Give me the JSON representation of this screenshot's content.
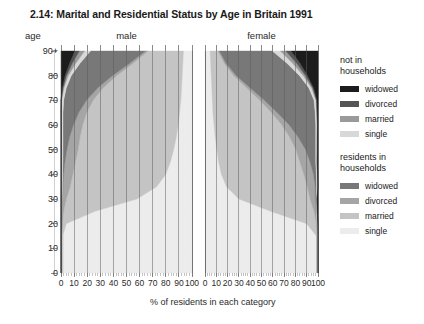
{
  "figure": {
    "title": "2.14: Marital and Residential Status by Age in Britain 1991",
    "age_axis_label": "age",
    "x_caption": "% of residents in each category"
  },
  "legend": {
    "groups": [
      {
        "heading_line1": "not in",
        "heading_line2": "households",
        "items": [
          {
            "label": "widowed",
            "color": "#1c1c1c"
          },
          {
            "label": "divorced",
            "color": "#555555"
          },
          {
            "label": "married",
            "color": "#9a9a9a"
          },
          {
            "label": "single",
            "color": "#d8d8d8"
          }
        ]
      },
      {
        "heading_line1": "residents in",
        "heading_line2": "households",
        "items": [
          {
            "label": "widowed",
            "color": "#787878"
          },
          {
            "label": "divorced",
            "color": "#a5a5a5"
          },
          {
            "label": "married",
            "color": "#c4c4c4"
          },
          {
            "label": "single",
            "color": "#ececec"
          }
        ]
      }
    ]
  },
  "chart_data": {
    "type": "area",
    "title": "2.14: Marital and Residential Status by Age in Britain 1991",
    "xlabel": "% of residents in each category",
    "ylabel": "age",
    "ylim": [
      0,
      90
    ],
    "xlim": [
      0,
      100
    ],
    "grid": true,
    "y_ticks": [
      "0",
      "10",
      "20",
      "30",
      "40",
      "50",
      "60",
      "70",
      "80",
      "90+"
    ],
    "y_tick_values": [
      0,
      10,
      20,
      30,
      40,
      50,
      60,
      70,
      80,
      90
    ],
    "x_ticks_male": [
      "100",
      "90",
      "80",
      "70",
      "60",
      "50",
      "40",
      "30",
      "20",
      "10",
      "0"
    ],
    "x_ticks_female": [
      "0",
      "10",
      "20",
      "30",
      "40",
      "50",
      "60",
      "70",
      "80",
      "90",
      "100"
    ],
    "x_tick_values": [
      0,
      10,
      20,
      30,
      40,
      50,
      60,
      70,
      80,
      90,
      100
    ],
    "panels": [
      {
        "name": "male",
        "label": "male",
        "x_direction": "reversed"
      },
      {
        "name": "female",
        "label": "female",
        "x_direction": "normal"
      }
    ],
    "stack_order_from_axis_origin": [
      "single_in_households",
      "married_in_households",
      "divorced_in_households",
      "widowed_in_households",
      "single_not_in_households",
      "married_not_in_households",
      "divorced_not_in_households",
      "widowed_not_in_households"
    ],
    "ages": [
      0,
      5,
      10,
      15,
      20,
      25,
      30,
      35,
      40,
      45,
      50,
      55,
      60,
      65,
      70,
      75,
      80,
      85,
      90
    ],
    "series": {
      "male": [
        {
          "name": "single_in_households",
          "color": "#ececec",
          "values": [
            98.8,
            98.8,
            98.8,
            98.6,
            96.0,
            74.0,
            42.0,
            27.0,
            20.0,
            16.5,
            14.0,
            12.0,
            10.5,
            9.5,
            8.5,
            8.0,
            7.5,
            7.0,
            6.5
          ]
        },
        {
          "name": "married_in_households",
          "color": "#c4c4c4",
          "values": [
            0.0,
            0.0,
            0.0,
            0.2,
            3.0,
            24.0,
            54.0,
            66.0,
            71.0,
            72.5,
            73.0,
            73.5,
            73.0,
            71.0,
            67.0,
            60.0,
            50.0,
            38.0,
            27.0
          ]
        },
        {
          "name": "divorced_in_households",
          "color": "#a5a5a5",
          "values": [
            0.0,
            0.0,
            0.0,
            0.0,
            0.3,
            1.2,
            3.0,
            5.5,
            7.0,
            8.0,
            8.5,
            8.0,
            7.0,
            6.0,
            5.0,
            4.0,
            3.2,
            2.5,
            2.0
          ]
        },
        {
          "name": "widowed_in_households",
          "color": "#787878",
          "values": [
            0.0,
            0.0,
            0.0,
            0.0,
            0.0,
            0.1,
            0.2,
            0.4,
            0.8,
            1.6,
            3.0,
            5.0,
            8.0,
            12.0,
            17.5,
            24.0,
            31.5,
            38.0,
            42.0
          ]
        },
        {
          "name": "single_not_in_households",
          "color": "#d8d8d8",
          "values": [
            1.2,
            1.2,
            1.2,
            1.2,
            0.7,
            0.6,
            0.6,
            0.7,
            0.8,
            0.9,
            1.0,
            1.1,
            1.2,
            1.3,
            1.5,
            1.8,
            2.3,
            3.2,
            4.5
          ]
        },
        {
          "name": "married_not_in_households",
          "color": "#9a9a9a",
          "values": [
            0.0,
            0.0,
            0.0,
            0.0,
            0.0,
            0.1,
            0.2,
            0.3,
            0.3,
            0.4,
            0.4,
            0.3,
            0.2,
            0.2,
            0.3,
            0.6,
            1.3,
            2.6,
            4.0
          ]
        },
        {
          "name": "divorced_not_in_households",
          "color": "#555555",
          "values": [
            0.0,
            0.0,
            0.0,
            0.0,
            0.0,
            0.0,
            0.0,
            0.1,
            0.1,
            0.1,
            0.1,
            0.1,
            0.1,
            0.0,
            0.2,
            0.6,
            1.2,
            2.2,
            3.5
          ]
        },
        {
          "name": "widowed_not_in_households",
          "color": "#1c1c1c",
          "values": [
            0.0,
            0.0,
            0.0,
            0.0,
            0.0,
            0.0,
            0.0,
            0.0,
            0.0,
            0.0,
            0.0,
            0.0,
            0.0,
            0.0,
            0.0,
            1.0,
            3.0,
            6.5,
            10.5
          ]
        }
      ],
      "female": [
        {
          "name": "single_in_households",
          "color": "#ececec",
          "values": [
            98.8,
            98.8,
            98.8,
            98.5,
            90.0,
            58.0,
            30.0,
            19.0,
            14.5,
            12.0,
            10.5,
            9.0,
            8.0,
            7.0,
            6.5,
            6.0,
            5.5,
            5.0,
            4.5
          ]
        },
        {
          "name": "married_in_households",
          "color": "#c4c4c4",
          "values": [
            0.0,
            0.0,
            0.0,
            0.3,
            8.5,
            38.5,
            63.0,
            71.5,
            73.0,
            72.0,
            70.0,
            66.0,
            60.0,
            52.0,
            42.0,
            31.0,
            20.0,
            12.0,
            7.0
          ]
        },
        {
          "name": "divorced_in_households",
          "color": "#a5a5a5",
          "values": [
            0.0,
            0.0,
            0.0,
            0.0,
            0.4,
            1.8,
            4.5,
            7.0,
            8.5,
            9.0,
            8.5,
            7.5,
            6.5,
            5.0,
            4.0,
            3.0,
            2.2,
            1.6,
            1.2
          ]
        },
        {
          "name": "widowed_in_households",
          "color": "#787878",
          "values": [
            0.0,
            0.0,
            0.0,
            0.0,
            0.1,
            0.3,
            0.7,
            1.3,
            2.5,
            5.0,
            9.0,
            15.5,
            23.5,
            33.5,
            44.0,
            52.0,
            56.0,
            54.0,
            47.0
          ]
        },
        {
          "name": "single_not_in_households",
          "color": "#d8d8d8",
          "values": [
            1.2,
            1.2,
            1.2,
            1.2,
            0.9,
            0.7,
            0.7,
            0.7,
            0.8,
            0.9,
            1.0,
            1.1,
            1.2,
            1.4,
            1.7,
            2.3,
            3.3,
            5.0,
            7.0
          ]
        },
        {
          "name": "married_not_in_households",
          "color": "#9a9a9a",
          "values": [
            0.0,
            0.0,
            0.0,
            0.0,
            0.0,
            0.1,
            0.2,
            0.3,
            0.3,
            0.4,
            0.4,
            0.3,
            0.3,
            0.3,
            0.5,
            1.0,
            2.0,
            3.4,
            4.8
          ]
        },
        {
          "name": "divorced_not_in_households",
          "color": "#555555",
          "values": [
            0.0,
            0.0,
            0.0,
            0.0,
            0.0,
            0.0,
            0.1,
            0.1,
            0.1,
            0.2,
            0.2,
            0.2,
            0.2,
            0.2,
            0.4,
            0.9,
            1.8,
            3.2,
            4.8
          ]
        },
        {
          "name": "widowed_not_in_households",
          "color": "#1c1c1c",
          "values": [
            0.0,
            0.0,
            0.0,
            0.0,
            0.1,
            0.6,
            0.8,
            0.1,
            0.3,
            0.5,
            0.4,
            0.4,
            0.3,
            0.6,
            0.9,
            3.8,
            9.2,
            15.8,
            23.7
          ]
        }
      ]
    }
  }
}
